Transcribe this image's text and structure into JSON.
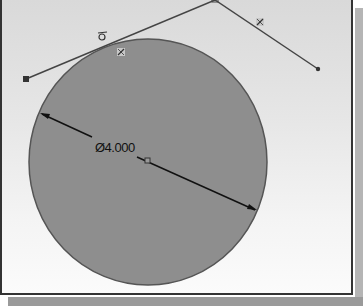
{
  "sketch": {
    "dimension": {
      "symbol": "Ø",
      "value": "4.000",
      "label": "Ø4.000"
    },
    "relations": [
      {
        "type": "tangent",
        "icon": "tangent-relation-icon"
      },
      {
        "type": "coincident",
        "icon": "relation-icon"
      },
      {
        "type": "relation",
        "icon": "relation-icon"
      }
    ],
    "colors": {
      "circle_fill": "#8e8e8e",
      "circle_stroke": "#555555",
      "line": "#444444",
      "background_top": "#d9d9d9",
      "background_bottom": "#fbfbfb"
    }
  }
}
